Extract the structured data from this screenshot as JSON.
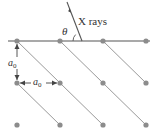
{
  "diagram": {
    "xray_label": "X rays",
    "angle_label": "θ",
    "spacing_label_vertical": "a",
    "spacing_label_vertical_sub": "0",
    "spacing_label_horizontal": "a",
    "spacing_label_horizontal_sub": "0",
    "lattice": {
      "columns_x": [
        17,
        60,
        103,
        146
      ],
      "rows_y": [
        41,
        83,
        125
      ],
      "dot_radius": 2.6,
      "dot_color": "#8c8c8c"
    },
    "surface_line": {
      "x1": 8,
      "y1": 41,
      "x2": 150,
      "y2": 41,
      "color": "#555555"
    },
    "diagonal_planes": [
      {
        "x1": 17,
        "y1": 41,
        "x2": 103,
        "y2": 125
      },
      {
        "x1": 17,
        "y1": 83,
        "x2": 60,
        "y2": 125
      },
      {
        "x1": 60,
        "y1": 41,
        "x2": 146,
        "y2": 125
      },
      {
        "x1": 103,
        "y1": 41,
        "x2": 146,
        "y2": 83
      }
    ],
    "diagonal_color": "#9a9a9a",
    "xray_beam": {
      "x1": 67,
      "y1": 2,
      "x2": 82,
      "y2": 41,
      "color": "#555555"
    },
    "colors": {
      "text": "#333333",
      "arrow": "#444444"
    }
  }
}
